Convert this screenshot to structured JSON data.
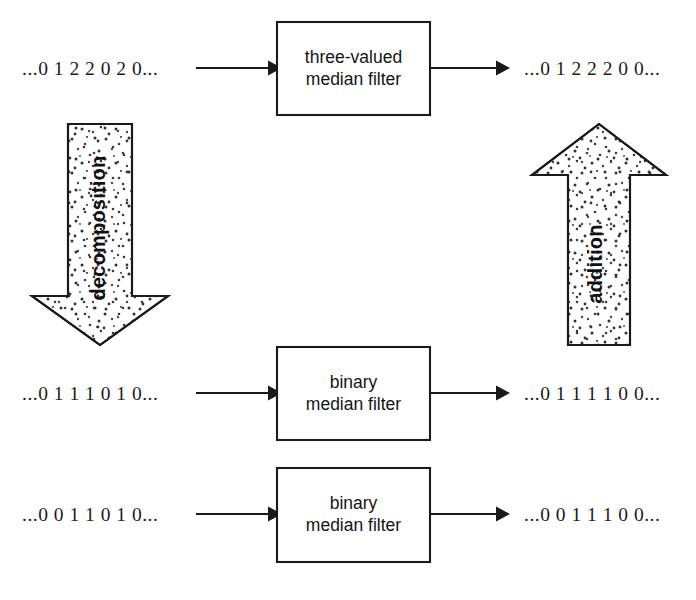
{
  "diagram": {
    "background_color": "#ffffff",
    "line_color": "#1a1a1a",
    "stipple_color": "#3a3a3a",
    "rows": [
      {
        "id": "row-top",
        "input_label": "...0 1 2 2 0 2 0...",
        "filter_label_line1": "three-valued",
        "filter_label_line2": "median filter",
        "output_label": "...0 1 2 2 2 0 0..."
      },
      {
        "id": "row-middle",
        "input_label": "...0 1 1 1 0 1 0...",
        "filter_label_line1": "binary",
        "filter_label_line2": "median filter",
        "output_label": "...0 1 1 1 1 0 0..."
      },
      {
        "id": "row-bottom",
        "input_label": "...0 0 1 1 0 1 0...",
        "filter_label_line1": "binary",
        "filter_label_line2": "median filter",
        "output_label": "...0 0 1 1 1 0 0..."
      }
    ],
    "block_arrows": [
      {
        "id": "decomposition-arrow",
        "label": "decomposition",
        "direction": "down"
      },
      {
        "id": "addition-arrow",
        "label": "addition",
        "direction": "up"
      }
    ]
  }
}
